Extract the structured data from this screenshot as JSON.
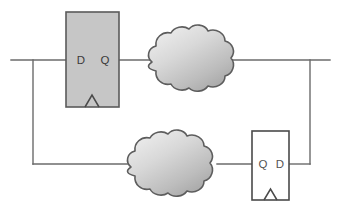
{
  "diagram": {
    "background_color": "#ffffff",
    "wire_color": "#6b6b6b",
    "components": {
      "flipflop_top": {
        "name": "D flip-flop (top)",
        "d_label": "D",
        "q_label": "Q",
        "clock_symbol": "triangle",
        "fill_color": "#c6c6c6",
        "stroke_color": "#5a5a5a",
        "x": 66,
        "y": 12,
        "width": 53,
        "height": 95
      },
      "flipflop_bottom": {
        "name": "D flip-flop (bottom, mirrored)",
        "q_label": "Q",
        "d_label": "D",
        "clock_symbol": "triangle",
        "fill_color": "#ffffff",
        "stroke_color": "#4a4a4a",
        "x": 252,
        "y": 131,
        "width": 37,
        "height": 69
      },
      "cloud_top": {
        "name": "Combinational logic cloud (top)",
        "fill_light": "#e3e3e3",
        "fill_dark": "#9d9d9d",
        "stroke_color": "#5d5d5d",
        "cx": 189,
        "cy": 59
      },
      "cloud_bottom": {
        "name": "Combinational logic cloud (bottom)",
        "fill_light": "#e3e3e3",
        "fill_dark": "#9d9d9d",
        "stroke_color": "#5d5d5d",
        "cx": 174,
        "cy": 167
      }
    },
    "wires": {
      "top_rail_y": 60,
      "bottom_rail_y": 164,
      "left_branch_x": 33,
      "right_branch_x": 310,
      "left_input_x": 11,
      "right_output_x": 330
    }
  }
}
